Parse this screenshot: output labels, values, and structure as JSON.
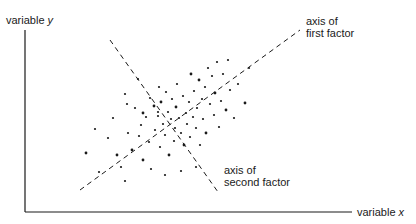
{
  "labels": {
    "y_axis": "variable",
    "y_axis_var": "y",
    "x_axis": "variable",
    "x_axis_var": "x",
    "first_factor_line1": "axis of",
    "first_factor_line2": "first factor",
    "second_factor_line1": "axis of",
    "second_factor_line2": "second factor"
  },
  "colors": {
    "ink": "#1a1a1a",
    "background": "#ffffff"
  },
  "axes": {
    "origin": [
      25,
      212
    ],
    "y_top": [
      25,
      30
    ],
    "x_right": [
      352,
      212
    ]
  },
  "factor_axes": {
    "first": {
      "from": [
        80,
        190
      ],
      "to": [
        300,
        30
      ]
    },
    "second": {
      "from": [
        110,
        40
      ],
      "to": [
        218,
        192
      ]
    }
  },
  "points": [
    [
      86,
      153
    ],
    [
      95,
      129
    ],
    [
      99,
      172
    ],
    [
      108,
      138
    ],
    [
      113,
      118
    ],
    [
      117,
      155
    ],
    [
      125,
      94
    ],
    [
      121,
      167
    ],
    [
      127,
      104
    ],
    [
      128,
      133
    ],
    [
      132,
      150
    ],
    [
      135,
      108
    ],
    [
      138,
      79
    ],
    [
      139,
      136
    ],
    [
      141,
      125
    ],
    [
      143,
      160
    ],
    [
      146,
      117
    ],
    [
      149,
      142
    ],
    [
      150,
      98
    ],
    [
      151,
      169
    ],
    [
      154,
      106
    ],
    [
      155,
      130
    ],
    [
      158,
      116
    ],
    [
      159,
      87
    ],
    [
      160,
      147
    ],
    [
      161,
      102
    ],
    [
      163,
      124
    ],
    [
      165,
      135
    ],
    [
      166,
      92
    ],
    [
      168,
      112
    ],
    [
      169,
      155
    ],
    [
      171,
      119
    ],
    [
      172,
      99
    ],
    [
      174,
      141
    ],
    [
      175,
      128
    ],
    [
      176,
      107
    ],
    [
      177,
      84
    ],
    [
      179,
      118
    ],
    [
      181,
      133
    ],
    [
      183,
      96
    ],
    [
      184,
      145
    ],
    [
      186,
      113
    ],
    [
      187,
      124
    ],
    [
      189,
      102
    ],
    [
      190,
      137
    ],
    [
      191,
      74
    ],
    [
      193,
      117
    ],
    [
      194,
      91
    ],
    [
      196,
      128
    ],
    [
      197,
      108
    ],
    [
      199,
      80
    ],
    [
      200,
      145
    ],
    [
      202,
      99
    ],
    [
      203,
      119
    ],
    [
      205,
      87
    ],
    [
      206,
      133
    ],
    [
      208,
      68
    ],
    [
      210,
      104
    ],
    [
      212,
      76
    ],
    [
      214,
      115
    ],
    [
      215,
      93
    ],
    [
      217,
      62
    ],
    [
      219,
      127
    ],
    [
      221,
      101
    ],
    [
      223,
      74
    ],
    [
      226,
      110
    ],
    [
      228,
      60
    ],
    [
      230,
      90
    ],
    [
      234,
      118
    ],
    [
      238,
      84
    ],
    [
      245,
      103
    ],
    [
      249,
      68
    ],
    [
      196,
      167
    ],
    [
      181,
      171
    ],
    [
      158,
      112
    ],
    [
      143,
      113
    ],
    [
      125,
      181
    ],
    [
      165,
      175
    ]
  ]
}
